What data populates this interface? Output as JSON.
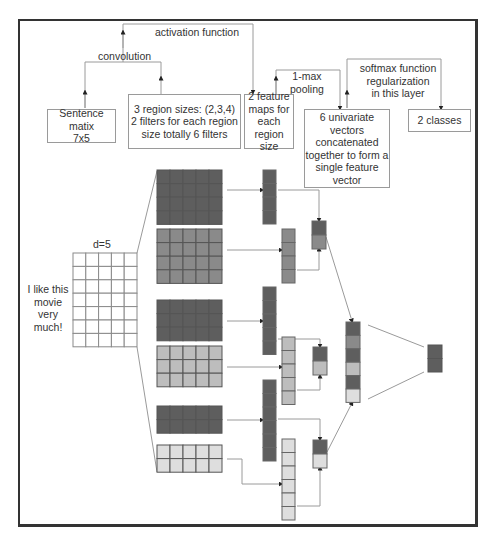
{
  "labels": {
    "activation": "activation function",
    "convolution": "convolution",
    "pooling": "1-max\npooling",
    "softmax": "softmax function\nregularization\nin this layer",
    "d": "d=5",
    "sentence": "I like this\nmovie very\nmuch!"
  },
  "boxes": {
    "sentence_matrix": "Sentence matix\n7x5",
    "region_sizes": "3 region sizes: (2,3,4)\n2 filters for each region\nsize totally 6 filters",
    "feature_maps": "2 feature\nmaps for\neach\nregion size",
    "univariate": "6 univariate\nvectors\nconcatenated\ntogether to form a\nsingle feature\nvector",
    "classes": "2 classes"
  },
  "colors": {
    "dark": "#5e5e5e",
    "medium": "#8a8a8a",
    "light": "#bdbdbd",
    "very_light": "#dedede",
    "line": "#9a9a9a",
    "frame": "#333333"
  },
  "diagram": {
    "sentence_matrix": {
      "rows": 7,
      "cols": 5
    },
    "filters": [
      {
        "region_size": 4,
        "shade": "dark"
      },
      {
        "region_size": 4,
        "shade": "medium"
      },
      {
        "region_size": 3,
        "shade": "dark"
      },
      {
        "region_size": 3,
        "shade": "light"
      },
      {
        "region_size": 2,
        "shade": "dark"
      },
      {
        "region_size": 2,
        "shade": "very_light"
      }
    ],
    "feature_map_lengths": [
      4,
      4,
      5,
      5,
      6,
      6
    ],
    "concatenated_vector_length": 6,
    "output_classes": 2
  }
}
